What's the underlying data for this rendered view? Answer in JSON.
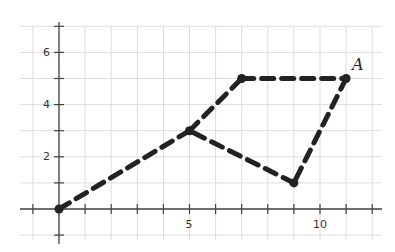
{
  "figure": {
    "type": "coordinate-plane",
    "grid": true,
    "x_range": [
      -1,
      12
    ],
    "y_range": [
      -1,
      7
    ],
    "x_tick_labels": [
      {
        "value": 5,
        "label": "5"
      },
      {
        "value": 10,
        "label": "10"
      }
    ],
    "y_tick_labels": [
      {
        "value": 2,
        "label": "2"
      },
      {
        "value": 4,
        "label": "4"
      },
      {
        "value": 6,
        "label": "6"
      }
    ],
    "path_style": "dashed",
    "path_color": "#222222",
    "grid_color": "#dddddd",
    "axis_color": "#444444",
    "points": [
      {
        "x": 0,
        "y": 0,
        "label": ""
      },
      {
        "x": 5,
        "y": 3,
        "label": ""
      },
      {
        "x": 7,
        "y": 5,
        "label": ""
      },
      {
        "x": 11,
        "y": 5,
        "label": "A"
      },
      {
        "x": 9,
        "y": 1,
        "label": ""
      }
    ],
    "segments": [
      [
        [
          0,
          0
        ],
        [
          5,
          3
        ]
      ],
      [
        [
          5,
          3
        ],
        [
          7,
          5
        ]
      ],
      [
        [
          7,
          5
        ],
        [
          11,
          5
        ]
      ],
      [
        [
          11,
          5
        ],
        [
          9,
          1
        ]
      ],
      [
        [
          9,
          1
        ],
        [
          5,
          3
        ]
      ]
    ],
    "labels": {
      "point_a": "A",
      "x_tick_5": "5",
      "x_tick_10": "10",
      "y_tick_2": "2",
      "y_tick_4": "4",
      "y_tick_6": "6"
    }
  }
}
